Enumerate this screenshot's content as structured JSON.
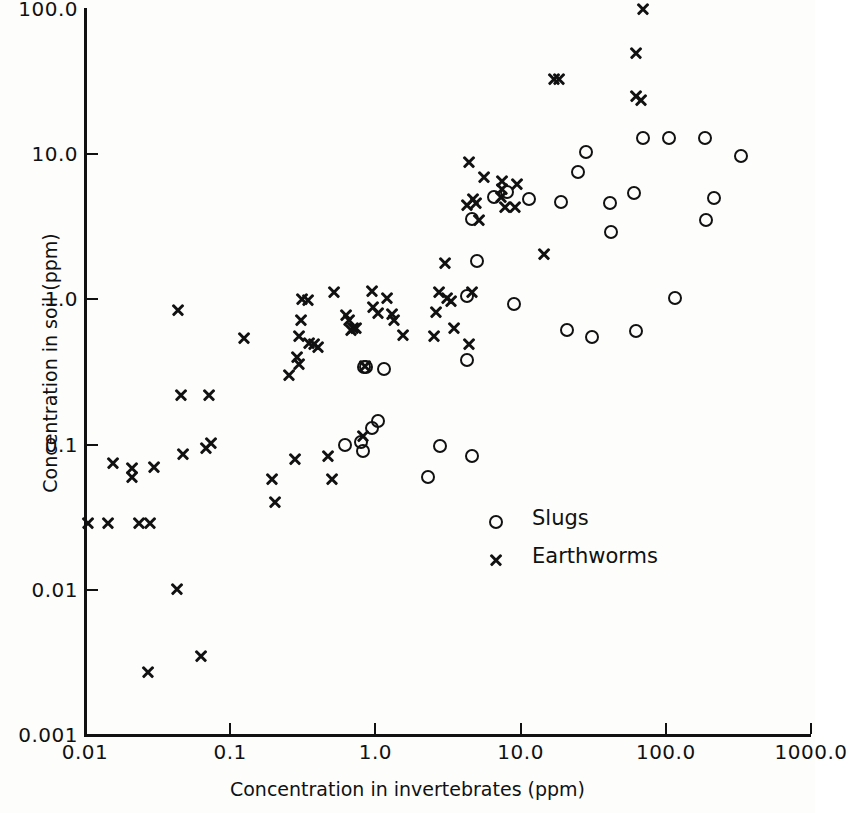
{
  "chart_data": {
    "type": "scatter",
    "title": "",
    "xlabel": "Concentration in invertebrates (ppm)",
    "ylabel": "Concentration in soil (ppm)",
    "xscale": "log",
    "yscale": "log",
    "xlim": [
      0.01,
      1000.0
    ],
    "ylim": [
      0.001,
      100.0
    ],
    "xticks": [
      "0.01",
      "0.1",
      "1.0",
      "10.0",
      "100.0",
      "1000.0"
    ],
    "xtick_values": [
      0.01,
      0.1,
      1.0,
      10.0,
      100.0,
      1000.0
    ],
    "yticks": [
      "100.0",
      "10.0",
      "1.0",
      "0.1",
      "0.01",
      "0.001"
    ],
    "ytick_values": [
      100.0,
      10.0,
      1.0,
      0.1,
      0.01,
      0.001
    ],
    "grid": false,
    "legend_position": "center-right-inside",
    "marker_color": "#111111",
    "series": [
      {
        "name": "Slugs",
        "marker": "circle",
        "points": [
          [
            0.83,
            0.34
          ],
          [
            0.86,
            0.34
          ],
          [
            0.8,
            0.105
          ],
          [
            0.82,
            0.091
          ],
          [
            0.95,
            0.13
          ],
          [
            1.05,
            0.145
          ],
          [
            1.15,
            0.33
          ],
          [
            0.62,
            0.1
          ],
          [
            2.3,
            0.06
          ],
          [
            2.8,
            0.098
          ],
          [
            4.6,
            0.083
          ],
          [
            4.3,
            0.38
          ],
          [
            4.3,
            1.05
          ],
          [
            5.0,
            1.85
          ],
          [
            4.6,
            3.6
          ],
          [
            6.6,
            5.1
          ],
          [
            8.0,
            5.5
          ],
          [
            11.5,
            4.9
          ],
          [
            9.0,
            0.93
          ],
          [
            19.0,
            4.7
          ],
          [
            21.0,
            0.62
          ],
          [
            28.0,
            10.4
          ],
          [
            25.0,
            7.6
          ],
          [
            31.0,
            0.55
          ],
          [
            41.0,
            4.6
          ],
          [
            42.0,
            2.9
          ],
          [
            60.0,
            5.4
          ],
          [
            62.0,
            0.61
          ],
          [
            70.0,
            13.0
          ],
          [
            105.0,
            13.0
          ],
          [
            115.0,
            1.02
          ],
          [
            185.0,
            13.0
          ],
          [
            190.0,
            3.5
          ],
          [
            215.0,
            5.0
          ],
          [
            330.0,
            9.7
          ]
        ]
      },
      {
        "name": "Earthworms",
        "marker": "cross",
        "points": [
          [
            0.0105,
            0.029
          ],
          [
            0.0145,
            0.029
          ],
          [
            0.0155,
            0.075
          ],
          [
            0.021,
            0.069
          ],
          [
            0.021,
            0.06
          ],
          [
            0.0235,
            0.029
          ],
          [
            0.028,
            0.029
          ],
          [
            0.027,
            0.0027
          ],
          [
            0.03,
            0.07
          ],
          [
            0.043,
            0.0102
          ],
          [
            0.044,
            0.85
          ],
          [
            0.046,
            0.22
          ],
          [
            0.047,
            0.086
          ],
          [
            0.063,
            0.0035
          ],
          [
            0.068,
            0.095
          ],
          [
            0.072,
            0.22
          ],
          [
            0.074,
            0.103
          ],
          [
            0.125,
            0.54
          ],
          [
            0.195,
            0.058
          ],
          [
            0.205,
            0.04
          ],
          [
            0.255,
            0.3
          ],
          [
            0.28,
            0.08
          ],
          [
            0.29,
            0.4
          ],
          [
            0.3,
            0.36
          ],
          [
            0.3,
            0.56
          ],
          [
            0.305,
            0.72
          ],
          [
            0.31,
            1.0
          ],
          [
            0.345,
            0.99
          ],
          [
            0.35,
            0.5
          ],
          [
            0.38,
            0.49
          ],
          [
            0.4,
            0.47
          ],
          [
            0.47,
            0.083
          ],
          [
            0.5,
            0.058
          ],
          [
            0.52,
            1.12
          ],
          [
            0.63,
            0.78
          ],
          [
            0.66,
            0.72
          ],
          [
            0.68,
            0.62
          ],
          [
            0.7,
            0.64
          ],
          [
            0.74,
            0.64
          ],
          [
            0.82,
            0.115
          ],
          [
            0.85,
            0.35
          ],
          [
            0.95,
            1.15
          ],
          [
            0.97,
            0.88
          ],
          [
            1.05,
            0.8
          ],
          [
            1.2,
            1.02
          ],
          [
            1.3,
            0.79
          ],
          [
            1.35,
            0.72
          ],
          [
            1.55,
            0.57
          ],
          [
            2.55,
            0.56
          ],
          [
            2.6,
            0.82
          ],
          [
            2.75,
            1.13
          ],
          [
            3.0,
            1.77
          ],
          [
            3.1,
            1.02
          ],
          [
            3.3,
            0.98
          ],
          [
            3.5,
            0.64
          ],
          [
            4.4,
            0.49
          ],
          [
            4.6,
            1.12
          ],
          [
            4.3,
            4.5
          ],
          [
            4.9,
            4.6
          ],
          [
            4.7,
            4.9
          ],
          [
            5.2,
            3.5
          ],
          [
            4.4,
            8.8
          ],
          [
            5.6,
            7.0
          ],
          [
            7.3,
            5.1
          ],
          [
            7.5,
            5.8
          ],
          [
            7.4,
            6.5
          ],
          [
            7.8,
            4.3
          ],
          [
            9.1,
            4.3
          ],
          [
            9.5,
            6.2
          ],
          [
            14.5,
            2.05
          ],
          [
            17.0,
            33.0
          ],
          [
            18.5,
            33.0
          ],
          [
            62.0,
            50.0
          ],
          [
            70.0,
            100.0
          ],
          [
            62.0,
            25.0
          ],
          [
            68.0,
            23.5
          ]
        ]
      }
    ]
  },
  "legend": {
    "entries": [
      {
        "label": "Slugs",
        "marker": "circle"
      },
      {
        "label": "Earthworms",
        "marker": "cross"
      }
    ]
  }
}
